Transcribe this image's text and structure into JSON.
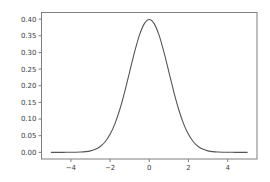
{
  "colors": {
    "background": "#ffffff",
    "spine": "#7f7f7f",
    "tick_label": "#3c3c3c",
    "curve": "#555555"
  },
  "chart_data": {
    "type": "line",
    "title": "",
    "xlabel": "",
    "ylabel": "",
    "grid": false,
    "legend": "none",
    "xlim": [
      -5.5,
      5.5
    ],
    "ylim": [
      -0.02,
      0.42
    ],
    "xticks": {
      "values": [
        -4,
        -2,
        0,
        2,
        4
      ],
      "labels": [
        "−4",
        "−2",
        "0",
        "2",
        "4"
      ]
    },
    "yticks": {
      "values": [
        0.0,
        0.05,
        0.1,
        0.15,
        0.2,
        0.25,
        0.3,
        0.35,
        0.4
      ],
      "labels": [
        "0.00",
        "0.05",
        "0.10",
        "0.15",
        "0.20",
        "0.25",
        "0.30",
        "0.35",
        "0.40"
      ]
    },
    "series": [
      {
        "name": "standard-normal-pdf",
        "color": "#555555",
        "x": [
          -5.0,
          -4.75,
          -4.5,
          -4.25,
          -4.0,
          -3.75,
          -3.5,
          -3.25,
          -3.0,
          -2.75,
          -2.5,
          -2.25,
          -2.0,
          -1.75,
          -1.5,
          -1.25,
          -1.0,
          -0.75,
          -0.5,
          -0.25,
          0.0,
          0.25,
          0.5,
          0.75,
          1.0,
          1.25,
          1.5,
          1.75,
          2.0,
          2.25,
          2.5,
          2.75,
          3.0,
          3.25,
          3.5,
          3.75,
          4.0,
          4.25,
          4.5,
          4.75,
          5.0
        ],
        "y": [
          0.0,
          1e-05,
          2e-05,
          5e-05,
          0.00013,
          0.00035,
          0.00087,
          0.00203,
          0.00443,
          0.00909,
          0.01753,
          0.03174,
          0.05399,
          0.08628,
          0.12952,
          0.18265,
          0.24197,
          0.30114,
          0.35207,
          0.38667,
          0.39894,
          0.38667,
          0.35207,
          0.30114,
          0.24197,
          0.18265,
          0.12952,
          0.08628,
          0.05399,
          0.03174,
          0.01753,
          0.00909,
          0.00443,
          0.00203,
          0.00087,
          0.00035,
          0.00013,
          5e-05,
          2e-05,
          1e-05,
          0.0
        ]
      }
    ]
  }
}
